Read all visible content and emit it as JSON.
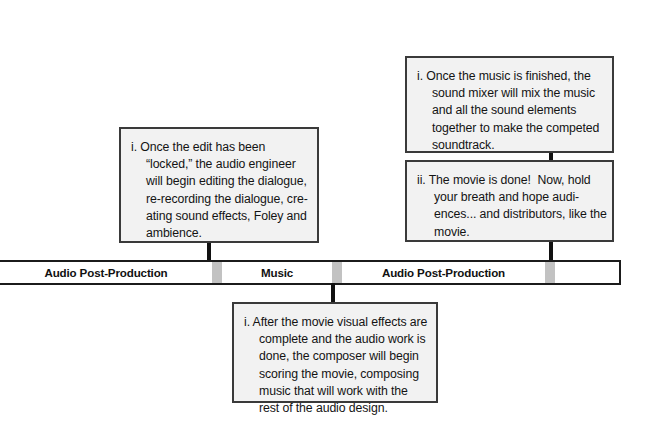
{
  "diagram": {
    "accent_border": "#3a3a3a",
    "box_fill": "#f2f2f2",
    "divider_color": "#c2c2c2"
  },
  "timeline": {
    "segments": [
      {
        "label": "Audio Post-Production"
      },
      {
        "label": ""
      },
      {
        "label": "Music"
      },
      {
        "label": ""
      },
      {
        "label": "Audio Post-Production"
      },
      {
        "label": ""
      },
      {
        "label": ""
      }
    ]
  },
  "callouts": {
    "audio_post_left": {
      "lines": [
        "i. Once the edit has been",
        "“locked,” the audio engineer",
        "will begin editing the dialogue,",
        "re-recording the dialogue, cre-",
        "ating sound effects, Foley and",
        "ambience."
      ]
    },
    "mix_top_right": {
      "lines": [
        "i. Once the music is finished, the",
        "sound mixer will mix the music",
        "and all the sound elements",
        "together to make the competed",
        "soundtrack."
      ]
    },
    "movie_done_right": {
      "lines": [
        "ii. The movie is done!  Now, hold",
        "your breath and hope audi-",
        "ences... and distributors, like the",
        "movie."
      ]
    },
    "music_bottom": {
      "lines": [
        "i. After the movie visual effects are",
        "complete and the audio work is",
        "done, the composer will begin",
        "scoring the movie, composing",
        "music that will work with the",
        "rest of the audio design."
      ]
    }
  }
}
